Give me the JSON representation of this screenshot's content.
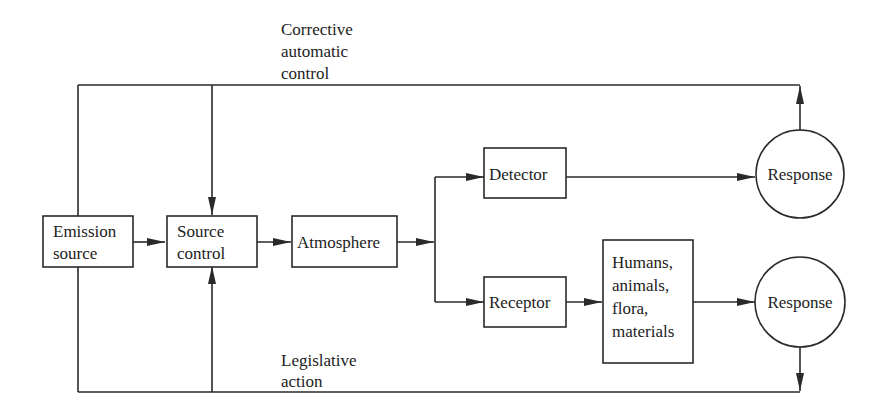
{
  "diagram": {
    "type": "block-flow",
    "nodes": {
      "emission_source": {
        "lines": [
          "Emission",
          "source"
        ]
      },
      "source_control": {
        "lines": [
          "Source",
          "control"
        ]
      },
      "atmosphere": {
        "lines": [
          "Atmosphere"
        ]
      },
      "detector": {
        "lines": [
          "Detector"
        ]
      },
      "receptor": {
        "lines": [
          "Receptor"
        ]
      },
      "targets": {
        "lines": [
          "Humans,",
          "animals,",
          "flora,",
          "materials"
        ]
      },
      "response_top": {
        "lines": [
          "Response"
        ]
      },
      "response_bottom": {
        "lines": [
          "Response"
        ]
      }
    },
    "labels": {
      "corrective": [
        "Corrective",
        "automatic",
        "control"
      ],
      "legislative": [
        "Legislative",
        "action"
      ]
    },
    "edges": [
      {
        "from": "Emission source",
        "to": "Source control"
      },
      {
        "from": "Source control",
        "to": "Atmosphere"
      },
      {
        "from": "Atmosphere",
        "to": "Detector"
      },
      {
        "from": "Atmosphere",
        "to": "Receptor"
      },
      {
        "from": "Detector",
        "to": "Response (top)"
      },
      {
        "from": "Receptor",
        "to": "Humans, animals, flora, materials"
      },
      {
        "from": "Humans, animals, flora, materials",
        "to": "Response (bottom)"
      },
      {
        "from": "Response (top)",
        "to": "Source control",
        "label": "Corrective automatic control"
      },
      {
        "from": "Response (bottom)",
        "to": "Source control",
        "label": "Legislative action"
      }
    ]
  }
}
